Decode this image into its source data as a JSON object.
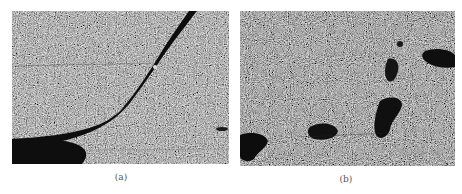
{
  "figure": {
    "panels": [
      {
        "id": "a",
        "caption": "(a)",
        "description": "grainy gray micrograph with dark curved crack band running from bottom-left to top-right"
      },
      {
        "id": "b",
        "caption": "(b)",
        "description": "grainy gray micrograph with scattered dark irregular pores/voids"
      }
    ]
  },
  "colors": {
    "background": "#ffffff",
    "texture_mid": "#6e6e6e",
    "dark_feature": "#111111",
    "caption_text": "#555555"
  }
}
